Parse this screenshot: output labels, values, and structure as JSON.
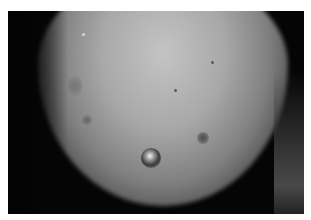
{
  "image": {
    "description": "Grayscale clinical photograph of skin showing a nipple and nearby small lesions",
    "colors": {
      "border": "#ffffff",
      "background": "#050505",
      "skin_highlight": "#c4c4c4",
      "skin_mid": "#808080"
    }
  }
}
